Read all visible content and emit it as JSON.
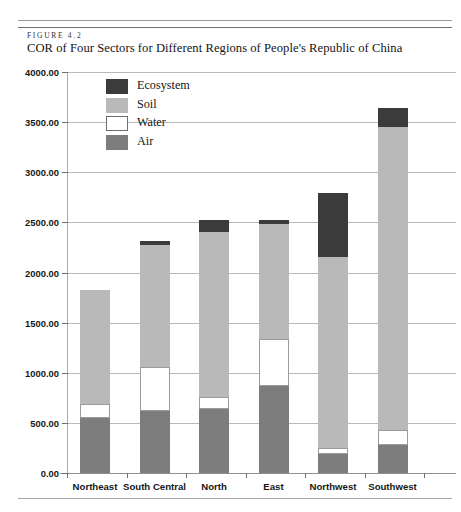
{
  "figure": {
    "label": "FIGURE 4.2",
    "title": "COR of Four Sectors for Different Regions of People's Republic of China"
  },
  "legend": {
    "position": "inside-top-left",
    "items": [
      {
        "label": "Ecosystem",
        "color": "#3b3b3b",
        "key": "ecosystem"
      },
      {
        "label": "Soil",
        "color": "#b9b9b9",
        "key": "soil"
      },
      {
        "label": "Water",
        "color": "#ffffff",
        "key": "water"
      },
      {
        "label": "Air",
        "color": "#7d7d7d",
        "key": "air"
      }
    ]
  },
  "axes": {
    "y_ticks": [
      "4000.00",
      "3500.00",
      "3000.00",
      "2500.00",
      "2000.00",
      "1500.00",
      "1000.00",
      "500.00",
      "0.00"
    ],
    "y_tick_values": [
      4000,
      3500,
      3000,
      2500,
      2000,
      1500,
      1000,
      500,
      0
    ]
  },
  "chart_data": {
    "type": "bar",
    "stacked": true,
    "title": "COR of Four Sectors for Different Regions of People's Republic of China",
    "xlabel": "",
    "ylabel": "",
    "ylim": [
      0,
      4000
    ],
    "ytick_step": 500,
    "grid": true,
    "legend_position": "inside-top-left",
    "categories": [
      "Northeast",
      "South Central",
      "North",
      "East",
      "Northwest",
      "Southwest"
    ],
    "series": [
      {
        "name": "Air",
        "color": "#7d7d7d",
        "values": [
          545,
          620,
          640,
          870,
          190,
          280
        ]
      },
      {
        "name": "Water",
        "color": "#ffffff",
        "values": [
          140,
          440,
          115,
          470,
          60,
          150
        ]
      },
      {
        "name": "Soil",
        "color": "#b9b9b9",
        "values": [
          1140,
          1210,
          1645,
          1140,
          1900,
          3020
        ]
      },
      {
        "name": "Ecosystem",
        "color": "#3b3b3b",
        "values": [
          0,
          40,
          120,
          40,
          640,
          190
        ]
      }
    ],
    "totals": [
      1825,
      2310,
      2520,
      2520,
      2790,
      3640
    ]
  }
}
